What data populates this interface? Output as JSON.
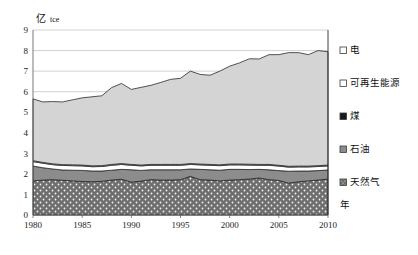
{
  "chart_data": {
    "type": "area",
    "stacked": true,
    "title": "",
    "subtitle": "",
    "ylabel": "亿 tce",
    "ylabel_main": "亿",
    "ylabel_unit": "tce",
    "xlabel": "年",
    "ylim": [
      0,
      9
    ],
    "xlim": [
      1980,
      2010
    ],
    "grid": true,
    "grid_axis": "y",
    "legend_position": "right",
    "y_ticks": [
      "0",
      "1",
      "2",
      "3",
      "4",
      "5",
      "6",
      "7",
      "8",
      "9"
    ],
    "y_tick_values": [
      0,
      1,
      2,
      3,
      4,
      5,
      6,
      7,
      8,
      9
    ],
    "x_ticks": [
      "1980",
      "1985",
      "1990",
      "1995",
      "2000",
      "2005",
      "2010"
    ],
    "x_tick_values": [
      1980,
      1985,
      1990,
      1995,
      2000,
      2005,
      2010
    ],
    "x": [
      1980,
      1981,
      1982,
      1983,
      1984,
      1985,
      1986,
      1987,
      1988,
      1989,
      1990,
      1991,
      1992,
      1993,
      1994,
      1995,
      1996,
      1997,
      1998,
      1999,
      2000,
      2001,
      2002,
      2003,
      2004,
      2005,
      2006,
      2007,
      2008,
      2009,
      2010
    ],
    "series": [
      {
        "name": "天然气",
        "legend_label": "天然气",
        "fill": "#6e6e6e",
        "pattern": "dots",
        "order": 1,
        "values": [
          1.66,
          1.7,
          1.72,
          1.69,
          1.66,
          1.63,
          1.62,
          1.64,
          1.7,
          1.74,
          1.6,
          1.65,
          1.72,
          1.7,
          1.7,
          1.72,
          1.88,
          1.72,
          1.7,
          1.66,
          1.7,
          1.72,
          1.75,
          1.8,
          1.72,
          1.68,
          1.55,
          1.62,
          1.66,
          1.7,
          1.75
        ]
      },
      {
        "name": "石油",
        "legend_label": "石油",
        "fill": "#8c8c8c",
        "pattern": "solid",
        "order": 2,
        "values": [
          0.72,
          0.6,
          0.52,
          0.5,
          0.52,
          0.54,
          0.52,
          0.5,
          0.48,
          0.48,
          0.6,
          0.52,
          0.48,
          0.5,
          0.5,
          0.48,
          0.36,
          0.5,
          0.5,
          0.52,
          0.52,
          0.5,
          0.46,
          0.42,
          0.48,
          0.48,
          0.58,
          0.52,
          0.48,
          0.46,
          0.44
        ]
      },
      {
        "name": "煤",
        "legend_label": "煤",
        "fill": "#ffffff",
        "pattern": "solid",
        "order": 3,
        "values": [
          0.22,
          0.22,
          0.21,
          0.22,
          0.22,
          0.22,
          0.21,
          0.22,
          0.24,
          0.24,
          0.22,
          0.22,
          0.22,
          0.22,
          0.22,
          0.22,
          0.22,
          0.22,
          0.22,
          0.22,
          0.22,
          0.22,
          0.22,
          0.2,
          0.22,
          0.22,
          0.2,
          0.2,
          0.2,
          0.2,
          0.2
        ]
      },
      {
        "name": "可再生能源",
        "legend_label": "可再生能源",
        "fill": "#f2f2f2",
        "pattern": "solid",
        "order": 4,
        "values": [
          0.04,
          0.04,
          0.04,
          0.04,
          0.04,
          0.04,
          0.04,
          0.04,
          0.04,
          0.04,
          0.04,
          0.04,
          0.04,
          0.04,
          0.04,
          0.04,
          0.04,
          0.04,
          0.04,
          0.04,
          0.04,
          0.04,
          0.04,
          0.04,
          0.04,
          0.04,
          0.04,
          0.04,
          0.04,
          0.04,
          0.04
        ]
      },
      {
        "name": "电",
        "legend_label": "电",
        "fill": "#d4d4d4",
        "pattern": "solid",
        "order": 5,
        "values": [
          3.01,
          2.94,
          3.03,
          3.05,
          3.16,
          3.27,
          3.36,
          3.4,
          3.74,
          3.9,
          3.65,
          3.78,
          3.85,
          3.99,
          4.14,
          4.19,
          4.5,
          4.36,
          4.34,
          4.56,
          4.76,
          4.92,
          5.13,
          5.13,
          5.34,
          5.38,
          5.53,
          5.52,
          5.42,
          5.6,
          5.51
        ]
      }
    ],
    "totals": [
      5.65,
      5.5,
      5.52,
      5.5,
      5.6,
      5.7,
      5.75,
      5.8,
      6.2,
      6.4,
      6.11,
      6.21,
      6.31,
      6.45,
      6.6,
      6.65,
      7.0,
      6.84,
      6.8,
      7.0,
      7.24,
      7.4,
      7.6,
      7.59,
      7.8,
      7.8,
      7.9,
      7.9,
      7.8,
      8.0,
      7.94
    ]
  },
  "legend": {
    "items": [
      {
        "label": "电",
        "swatch": "light-gray-outline"
      },
      {
        "label": "可再生能源",
        "swatch": "white-outline"
      },
      {
        "label": "煤",
        "swatch": "black-filled"
      },
      {
        "label": "石油",
        "swatch": "mid-gray"
      },
      {
        "label": "天然气",
        "swatch": "dotted-gray"
      }
    ]
  },
  "axes": {
    "y_unit_main": "亿",
    "y_unit_sub": "tce",
    "x_axis_label": "年"
  }
}
